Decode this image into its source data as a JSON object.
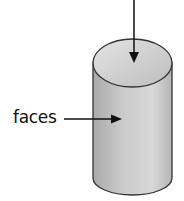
{
  "diagram": {
    "labels": [
      {
        "text": "faces",
        "points_to": "curved-side-face"
      }
    ],
    "arrows": [
      {
        "name": "top-arrow",
        "points_to": "top-face"
      },
      {
        "name": "faces-arrow",
        "points_to": "curved-side-face"
      }
    ]
  }
}
